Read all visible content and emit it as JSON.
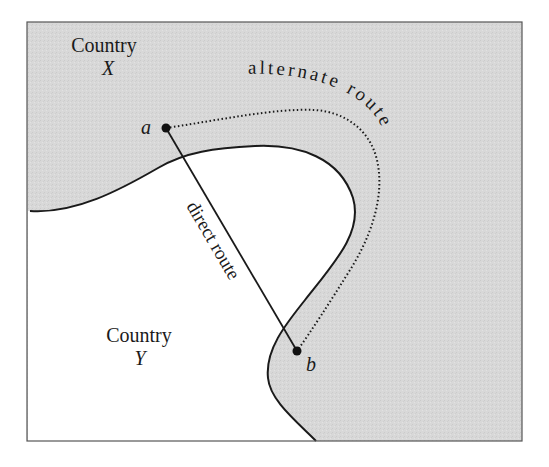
{
  "diagram": {
    "type": "map-route-diagram",
    "colors": {
      "country_x_fill": "#d6d6d6",
      "country_y_fill": "#ffffff",
      "border": "#1a1a1a",
      "frame": "#555555"
    },
    "regions": {
      "country_x": {
        "label_line1": "Country",
        "label_line2": "X"
      },
      "country_y": {
        "label_line1": "Country",
        "label_line2": "Y"
      }
    },
    "points": {
      "a": {
        "label": "a"
      },
      "b": {
        "label": "b"
      }
    },
    "routes": {
      "direct": {
        "label": "direct route",
        "style": "solid"
      },
      "alternate": {
        "label": "alternate route",
        "style": "dotted"
      }
    }
  }
}
